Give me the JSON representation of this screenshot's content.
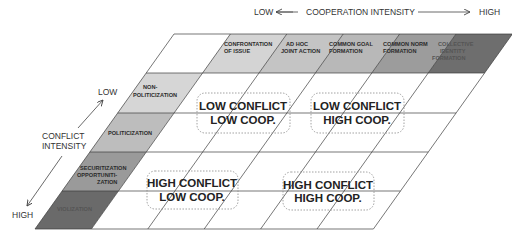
{
  "cooperation_axis": {
    "low_label": "LOW",
    "title": "COOPERATION INTENSITY",
    "high_label": "HIGH"
  },
  "conflict_axis": {
    "low_label": "LOW",
    "title_line1": "CONFLICT",
    "title_line2": "INTENSITY",
    "high_label": "HIGH"
  },
  "cooperation_levels": [
    {
      "line1": "CONFRONTATION",
      "line2": "OF ISSUE",
      "line3": "",
      "color": "#d4d4d4"
    },
    {
      "line1": "AD HOC",
      "line2": "JOINT ACTION",
      "line3": "",
      "color": "#c4c4c4"
    },
    {
      "line1": "COMMON GOAL",
      "line2": "FORMATION",
      "line3": "",
      "color": "#b8b8b8"
    },
    {
      "line1": "COMMON NORM",
      "line2": "FORMATION",
      "line3": "",
      "color": "#9c9c9c"
    },
    {
      "line1": "COLLECTIVE",
      "line2": "IDENTITY",
      "line3": "FORMATION",
      "color": "#6e6e6e"
    }
  ],
  "conflict_levels": [
    {
      "line1": "NON-",
      "line2": "POLITICIZATION",
      "line3": "",
      "color": "#d6d6d6"
    },
    {
      "line1": "POLITICIZATION",
      "line2": "",
      "line3": "",
      "color": "#bdbdbd"
    },
    {
      "line1": "SECURITIZATION",
      "line2": "OPPORTUNITI-",
      "line3": "ZATION",
      "color": "#9a9a9a"
    },
    {
      "line1": "VIOLIZATION",
      "line2": "",
      "line3": "",
      "color": "#6a6a6a"
    }
  ],
  "quadrants": [
    {
      "id": "low-low",
      "line1": "LOW CONFLICT",
      "line2": "LOW COOP."
    },
    {
      "id": "low-high",
      "line1": "LOW CONFLICT",
      "line2": "HIGH COOP."
    },
    {
      "id": "high-low",
      "line1": "HIGH CONFLICT",
      "line2": "LOW COOP."
    },
    {
      "id": "high-high",
      "line1": "HIGH CONFLICT",
      "line2": "HIGH COOP."
    }
  ],
  "colors": {
    "grid_line": "#3c3c3c",
    "quad_border": "#8a8a8a",
    "axis_text": "#333333"
  }
}
